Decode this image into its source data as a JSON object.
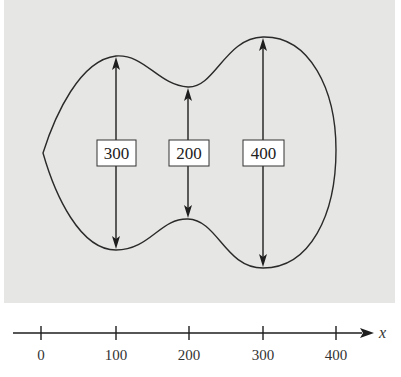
{
  "diagram": {
    "colors": {
      "panel": "#e6e6e4",
      "line": "#2a2a2a",
      "label_box": "#ffffff"
    },
    "measurements": [
      {
        "x": 100,
        "label": "300"
      },
      {
        "x": 200,
        "label": "200"
      },
      {
        "x": 300,
        "label": "400"
      }
    ],
    "axis": {
      "name": "x",
      "ticks": [
        "0",
        "100",
        "200",
        "300",
        "400"
      ]
    }
  }
}
